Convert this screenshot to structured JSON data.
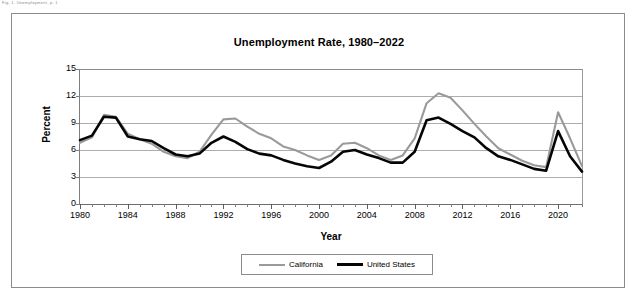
{
  "stray_header_text": "Fig. 1. Unemployment, p. 1",
  "figure": {
    "title": "Unemployment Rate, 1980–2022",
    "x_axis_title": "Year",
    "y_axis_title": "Percent"
  },
  "legend": {
    "entries": [
      {
        "label": "California",
        "color": "#9a9a9a",
        "marker": "line-swatch-gray"
      },
      {
        "label": "United States",
        "color": "#050505",
        "marker": "line-swatch-black"
      }
    ]
  },
  "chart_data": {
    "type": "line",
    "title": "Unemployment Rate, 1980–2022",
    "xlabel": "Year",
    "ylabel": "Percent",
    "xlim": [
      1980,
      2022
    ],
    "ylim": [
      0,
      15
    ],
    "ytick_labels": [
      "0",
      "3",
      "6",
      "9",
      "12",
      "15"
    ],
    "yticks": [
      0,
      3,
      6,
      9,
      12,
      15
    ],
    "xtick_labels": [
      "1980",
      "1984",
      "1988",
      "1992",
      "1996",
      "2000",
      "2004",
      "2008",
      "2012",
      "2016",
      "2020"
    ],
    "xticks": [
      1980,
      1984,
      1988,
      1992,
      1996,
      2000,
      2004,
      2008,
      2012,
      2016,
      2020
    ],
    "xtick_minor_step": 1,
    "grid": "horizontal",
    "legend_position": "bottom",
    "x": [
      1980,
      1981,
      1982,
      1983,
      1984,
      1985,
      1986,
      1987,
      1988,
      1989,
      1990,
      1991,
      1992,
      1993,
      1994,
      1995,
      1996,
      1997,
      1998,
      1999,
      2000,
      2001,
      2002,
      2003,
      2004,
      2005,
      2006,
      2007,
      2008,
      2009,
      2010,
      2011,
      2012,
      2013,
      2014,
      2015,
      2016,
      2017,
      2018,
      2019,
      2020,
      2021,
      2022
    ],
    "series": [
      {
        "name": "California",
        "color": "#9a9a9a",
        "values": [
          6.8,
          7.4,
          9.9,
          9.7,
          7.8,
          7.2,
          6.7,
          5.8,
          5.3,
          5.1,
          5.8,
          7.7,
          9.4,
          9.5,
          8.6,
          7.8,
          7.3,
          6.4,
          6.0,
          5.4,
          4.9,
          5.4,
          6.7,
          6.8,
          6.2,
          5.4,
          4.9,
          5.4,
          7.3,
          11.2,
          12.3,
          11.8,
          10.4,
          8.9,
          7.5,
          6.2,
          5.5,
          4.8,
          4.3,
          4.1,
          10.2,
          7.3,
          4.2
        ]
      },
      {
        "name": "United States",
        "color": "#050505",
        "values": [
          7.1,
          7.6,
          9.7,
          9.6,
          7.5,
          7.2,
          7.0,
          6.2,
          5.5,
          5.3,
          5.6,
          6.8,
          7.5,
          6.9,
          6.1,
          5.6,
          5.4,
          4.9,
          4.5,
          4.2,
          4.0,
          4.7,
          5.8,
          6.0,
          5.5,
          5.1,
          4.6,
          4.6,
          5.8,
          9.3,
          9.6,
          8.9,
          8.1,
          7.4,
          6.2,
          5.3,
          4.9,
          4.4,
          3.9,
          3.7,
          8.1,
          5.3,
          3.6
        ]
      }
    ]
  }
}
